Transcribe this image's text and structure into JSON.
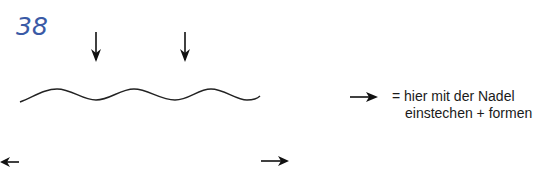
{
  "step": {
    "number": "38",
    "color": "#3a5aa6"
  },
  "diagram": {
    "wave": {
      "description": "wavy line (thread/wire)",
      "stroke": "#222222"
    },
    "needle_points": [
      {
        "icon": "arrow-down-icon",
        "x": 96
      },
      {
        "icon": "arrow-down-icon",
        "x": 185
      }
    ],
    "direction_arrows": [
      {
        "icon": "arrow-left-icon",
        "position": "bottom-left"
      },
      {
        "icon": "arrow-right-icon",
        "position": "bottom-right"
      }
    ]
  },
  "legend": {
    "icon": "arrow-right-icon",
    "line1": "= hier mit der Nadel",
    "line2": "einstechen + formen"
  }
}
